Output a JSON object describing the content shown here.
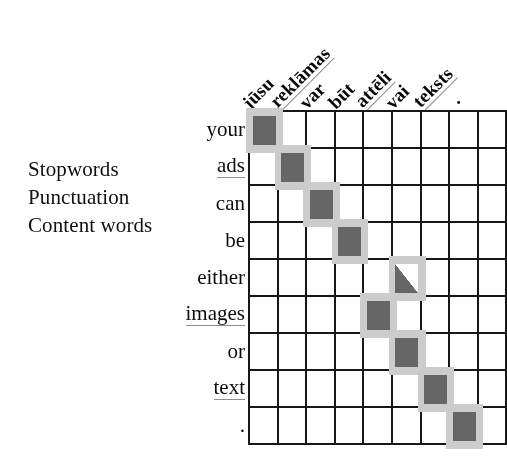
{
  "figure": {
    "legend": {
      "items": [
        {
          "label": "Stopwords",
          "style": "plain",
          "name": "legend-stopwords"
        },
        {
          "label": "Punctuation",
          "style": "plain",
          "name": "legend-punctuation"
        },
        {
          "label": "Content words",
          "style": "underlined",
          "name": "legend-content-words"
        }
      ]
    },
    "colors": {
      "grid_line": "#1b1b1b",
      "cell_background": "#fdfdfd",
      "alignment_fill": "#676767",
      "alignment_halo": "#c9c9c9",
      "content_word_underline": "#8e8e8e",
      "page_background": "#ffffff"
    }
  },
  "chart_data": {
    "type": "heatmap",
    "xlabel": "",
    "ylabel": "",
    "grid": true,
    "legend_position": "left",
    "columns": [
      {
        "label": "jūsu",
        "category": "stopword",
        "underlined": false
      },
      {
        "label": "reklāmas",
        "category": "content",
        "underlined": true
      },
      {
        "label": "var",
        "category": "stopword",
        "underlined": false
      },
      {
        "label": "būt",
        "category": "stopword",
        "underlined": false
      },
      {
        "label": "attēli",
        "category": "content",
        "underlined": true
      },
      {
        "label": "vai",
        "category": "stopword",
        "underlined": false
      },
      {
        "label": "teksts",
        "category": "content",
        "underlined": true
      },
      {
        "label": ".",
        "category": "punctuation",
        "underlined": false
      }
    ],
    "rows": [
      {
        "label": "your",
        "category": "stopword",
        "underlined": false
      },
      {
        "label": "ads",
        "category": "content",
        "underlined": true
      },
      {
        "label": "can",
        "category": "stopword",
        "underlined": false
      },
      {
        "label": "be",
        "category": "stopword",
        "underlined": false
      },
      {
        "label": "either",
        "category": "stopword",
        "underlined": false
      },
      {
        "label": "images",
        "category": "content",
        "underlined": true
      },
      {
        "label": "or",
        "category": "stopword",
        "underlined": false
      },
      {
        "label": "text",
        "category": "content",
        "underlined": true
      },
      {
        "label": ".",
        "category": "punctuation",
        "underlined": false
      }
    ],
    "n_columns": 9,
    "n_rows": 9,
    "cells": [
      {
        "row": 0,
        "col": 0,
        "value": 1,
        "fill": "full"
      },
      {
        "row": 1,
        "col": 1,
        "value": 1,
        "fill": "full"
      },
      {
        "row": 2,
        "col": 2,
        "value": 1,
        "fill": "full"
      },
      {
        "row": 3,
        "col": 3,
        "value": 1,
        "fill": "full"
      },
      {
        "row": 4,
        "col": 5,
        "value": 0.5,
        "fill": "half"
      },
      {
        "row": 5,
        "col": 4,
        "value": 1,
        "fill": "full"
      },
      {
        "row": 6,
        "col": 5,
        "value": 1,
        "fill": "full"
      },
      {
        "row": 7,
        "col": 6,
        "value": 1,
        "fill": "full"
      },
      {
        "row": 8,
        "col": 7,
        "value": 1,
        "fill": "full"
      }
    ],
    "source_sentence": "your ads can be either images or text .",
    "target_sentence": "jūsu reklāmas var būt attēli vai teksts ."
  }
}
